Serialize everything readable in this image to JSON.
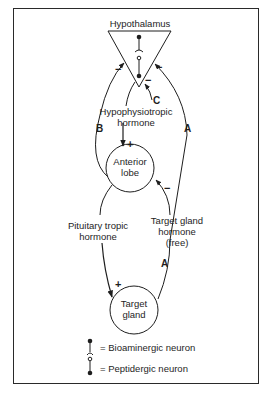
{
  "diagram": {
    "title_node": "Hypothalamus",
    "nodes": {
      "hypothalamus": "Hypothalamus",
      "anterior_lobe": [
        "Anterior",
        "lobe"
      ],
      "target_gland": [
        "Target",
        "gland"
      ]
    },
    "edge_labels": {
      "hypophysiotropic": [
        "Hypophysiotropic",
        "hormone"
      ],
      "pituitary_tropic": [
        "Pituitary tropic",
        "hormone"
      ],
      "target_gland_hormone": [
        "Target gland",
        "hormone",
        "(free)"
      ]
    },
    "loop_labels": {
      "A_upper": "A",
      "A_lower": "A",
      "B": "B",
      "C": "C"
    },
    "signs": {
      "plus": "+",
      "minus": "−"
    },
    "legend": {
      "bioaminergic": "= Bioaminergic neuron",
      "peptidergic": "= Peptidergic neuron"
    },
    "colors": {
      "ink": "#1e1e1e",
      "background": "#ffffff"
    }
  }
}
